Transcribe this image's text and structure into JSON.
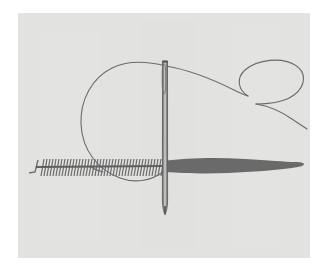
{
  "figure": {
    "title": "Threaded sewing needle piercing stitched fabric",
    "caption": "",
    "width": 329,
    "height": 275,
    "frame_color": "#ffffff",
    "canvas_color": "#e2e2e0",
    "canvas_rect": {
      "x": 18,
      "y": 13,
      "width": 292,
      "height": 245
    },
    "ink_color": "#6b6b6b",
    "ink_color_dark": "#5a5a5a",
    "needle_color": "#7a7a7a",
    "needle_highlight": "#d8d8d6",
    "blade_color": "#6a6a6a"
  },
  "elements": {
    "canvas": {
      "label": "paper-background"
    },
    "needle": {
      "label": "sewing-needle",
      "top_y": 60,
      "bottom_y": 214,
      "center_x": 165,
      "shaft_width": 5,
      "eye_top": 63,
      "eye_bottom": 96
    },
    "blade": {
      "label": "blade-shape",
      "left_x": 165,
      "right_x": 304,
      "center_y": 165,
      "max_thickness": 13
    },
    "zipper": {
      "label": "zipper-stitch-row",
      "left_x": 36,
      "right_x": 166,
      "baseline_y": 167,
      "teeth_count": 44,
      "tooth_height": 16,
      "slant_degrees": 10,
      "hook_x": 32,
      "hook_y": 172
    },
    "thread": {
      "label": "thread-line",
      "left_loop": {
        "label": "large-left-loop",
        "center_x": 124,
        "center_y": 127,
        "radius_x": 44,
        "radius_y": 60
      },
      "right_loop": {
        "label": "small-right-loop",
        "center_x": 268,
        "center_y": 85,
        "radius_x": 36,
        "radius_y": 22
      },
      "tail_end_x": 307,
      "tail_end_y": 129
    }
  }
}
